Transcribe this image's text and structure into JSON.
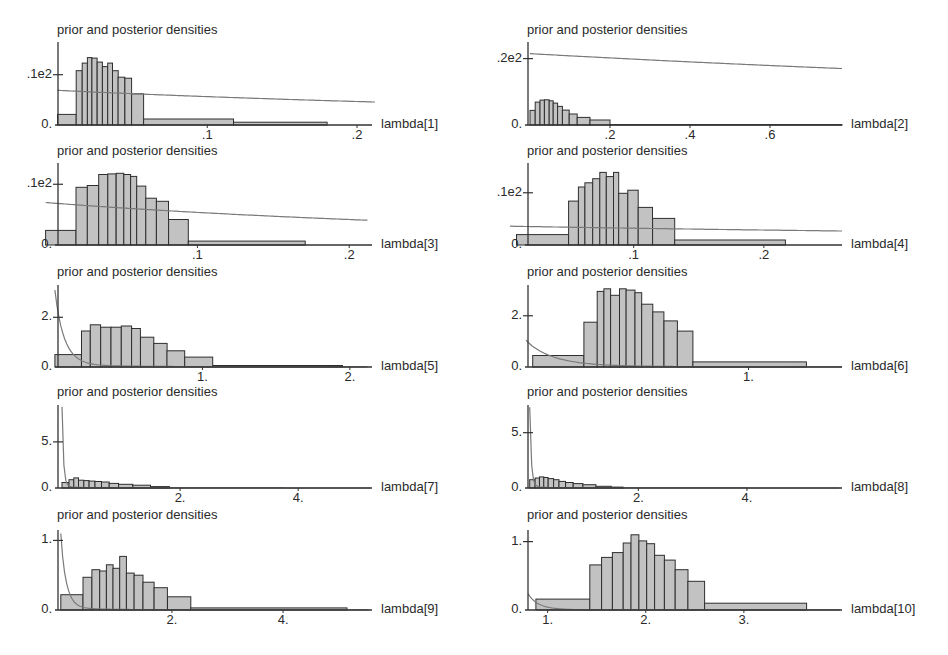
{
  "chart_data": [
    {
      "type": "bar",
      "title": "prior and posterior densities",
      "xlabel": "lambda[1]",
      "ylabel": "",
      "yticks": [
        {
          "v": 0,
          "label": "0."
        },
        {
          "v": 10,
          "label": ".1e2"
        }
      ],
      "xticks": [
        {
          "v": 0.1,
          "label": ".1"
        },
        {
          "v": 0.2,
          "label": ".2"
        }
      ],
      "xlim": [
        -0.005,
        0.21
      ],
      "ylim": [
        0,
        16.5
      ],
      "bars": [
        [
          0,
          0.0125,
          2.1
        ],
        [
          0.0125,
          0.0165,
          10.8
        ],
        [
          0.0165,
          0.02,
          12.3
        ],
        [
          0.02,
          0.023,
          13.4
        ],
        [
          0.023,
          0.0265,
          13.3
        ],
        [
          0.0265,
          0.03,
          12.5
        ],
        [
          0.03,
          0.0335,
          11.6
        ],
        [
          0.0335,
          0.0367,
          12.3
        ],
        [
          0.0367,
          0.0405,
          10.8
        ],
        [
          0.0405,
          0.045,
          9.5
        ],
        [
          0.045,
          0.0495,
          9.3
        ],
        [
          0.0495,
          0.0575,
          6.2
        ],
        [
          0.0575,
          0.1175,
          1.2
        ],
        [
          0.1175,
          0.18,
          0.55
        ]
      ],
      "prior": {
        "type": "decay",
        "y0": 6.9,
        "k": 0.6,
        "x_end": 0.212
      },
      "layout": {
        "col": 0,
        "baseline": 125,
        "top": 42,
        "x0px": 58,
        "x1px": 372,
        "title_y": 22,
        "xzero_px": 50
      }
    },
    {
      "type": "bar",
      "title": "prior and posterior densities",
      "xlabel": "lambda[2]",
      "yticks": [
        {
          "v": 0,
          "label": "0."
        },
        {
          "v": 20,
          "label": ".2e2"
        }
      ],
      "xticks": [
        {
          "v": 0.2,
          "label": ".2"
        },
        {
          "v": 0.4,
          "label": ".4"
        },
        {
          "v": 0.6,
          "label": ".6"
        }
      ],
      "xlim": [
        -0.01,
        0.78
      ],
      "ylim": [
        0,
        25
      ],
      "bars": [
        [
          0,
          0.013,
          4.4
        ],
        [
          0.013,
          0.025,
          6.9
        ],
        [
          0.025,
          0.036,
          7.5
        ],
        [
          0.036,
          0.048,
          7.6
        ],
        [
          0.048,
          0.058,
          7.3
        ],
        [
          0.058,
          0.069,
          6.6
        ],
        [
          0.069,
          0.081,
          5.6
        ],
        [
          0.081,
          0.098,
          4.5
        ],
        [
          0.098,
          0.118,
          3.3
        ],
        [
          0.118,
          0.15,
          2.3
        ],
        [
          0.15,
          0.2,
          1.5
        ],
        [
          0.2,
          0.78,
          0.12
        ]
      ],
      "prior": {
        "type": "decay",
        "y0": 21.5,
        "k": 0.09,
        "x_end": 0.78
      },
      "layout": {
        "col": 1,
        "baseline": 125,
        "top": 42,
        "x0px": 528,
        "x1px": 842,
        "title_y": 22,
        "xzero_px": 526
      }
    },
    {
      "type": "bar",
      "title": "prior and posterior densities",
      "xlabel": "lambda[3]",
      "yticks": [
        {
          "v": 0,
          "label": "0."
        },
        {
          "v": 10,
          "label": ".1e2"
        }
      ],
      "xticks": [
        {
          "v": 0.1,
          "label": ".1"
        },
        {
          "v": 0.2,
          "label": ".2"
        }
      ],
      "xlim": [
        -0.005,
        0.215
      ],
      "ylim": [
        0,
        13.5
      ],
      "bars": [
        [
          0,
          0.02,
          2.4
        ],
        [
          0.02,
          0.0275,
          9.5
        ],
        [
          0.0275,
          0.035,
          9.8
        ],
        [
          0.035,
          0.041,
          11.6
        ],
        [
          0.041,
          0.0465,
          11.7
        ],
        [
          0.0465,
          0.0515,
          11.8
        ],
        [
          0.0515,
          0.056,
          11.6
        ],
        [
          0.056,
          0.06,
          11.3
        ],
        [
          0.06,
          0.066,
          9.7
        ],
        [
          0.066,
          0.073,
          7.7
        ],
        [
          0.073,
          0.081,
          7.2
        ],
        [
          0.081,
          0.094,
          4.2
        ],
        [
          0.094,
          0.171,
          0.65
        ]
      ],
      "prior": {
        "type": "decay",
        "y0": 7.0,
        "k": 0.8,
        "x_end": 0.212
      },
      "layout": {
        "col": 0,
        "baseline": 245,
        "top": 163,
        "x0px": 58,
        "x1px": 372,
        "title_y": 143,
        "xzero_px": 38
      }
    },
    {
      "type": "bar",
      "title": "prior and posterior densities",
      "xlabel": "lambda[4]",
      "yticks": [
        {
          "v": 0,
          "label": "0."
        },
        {
          "v": 10,
          "label": ".1e2"
        }
      ],
      "xticks": [
        {
          "v": 0.1,
          "label": ".1"
        },
        {
          "v": 0.2,
          "label": ".2"
        }
      ],
      "xlim": [
        0.005,
        0.26
      ],
      "ylim": [
        0,
        15.7
      ],
      "bars": [
        [
          0.01,
          0.05,
          2.0
        ],
        [
          0.05,
          0.0575,
          8.4
        ],
        [
          0.0575,
          0.0625,
          11.1
        ],
        [
          0.0625,
          0.0685,
          11.9
        ],
        [
          0.0685,
          0.074,
          12.7
        ],
        [
          0.074,
          0.079,
          13.9
        ],
        [
          0.079,
          0.0845,
          13.1
        ],
        [
          0.0845,
          0.0885,
          13.9
        ],
        [
          0.0885,
          0.0955,
          9.9
        ],
        [
          0.0955,
          0.1035,
          10.5
        ],
        [
          0.1035,
          0.1145,
          7.2
        ],
        [
          0.1145,
          0.1315,
          5.1
        ],
        [
          0.1315,
          0.2165,
          0.95
        ]
      ],
      "prior": {
        "type": "decay",
        "y0": 3.6,
        "k": 0.35,
        "x_end": 0.26
      },
      "layout": {
        "col": 1,
        "baseline": 245,
        "top": 163,
        "x0px": 528,
        "x1px": 842,
        "title_y": 143,
        "xzero_px": 510
      }
    },
    {
      "type": "bar",
      "title": "prior and posterior densities",
      "xlabel": "lambda[5]",
      "yticks": [
        {
          "v": 0,
          "label": "0."
        },
        {
          "v": 2,
          "label": "2."
        }
      ],
      "xticks": [
        {
          "v": 1,
          "label": "1."
        },
        {
          "v": 2,
          "label": "2."
        }
      ],
      "xlim": [
        -0.02,
        2.15
      ],
      "ylim": [
        0,
        3.3
      ],
      "bars": [
        [
          0,
          0.18,
          0.5
        ],
        [
          0.18,
          0.24,
          1.45
        ],
        [
          0.24,
          0.31,
          1.7
        ],
        [
          0.31,
          0.38,
          1.6
        ],
        [
          0.38,
          0.45,
          1.6
        ],
        [
          0.45,
          0.52,
          1.65
        ],
        [
          0.52,
          0.58,
          1.55
        ],
        [
          0.58,
          0.67,
          1.2
        ],
        [
          0.67,
          0.76,
          0.95
        ],
        [
          0.76,
          0.88,
          0.65
        ],
        [
          0.88,
          1.07,
          0.4
        ],
        [
          1.07,
          1.95,
          0.06
        ]
      ],
      "prior": {
        "type": "decay",
        "y0": 3.1,
        "k": 5.0,
        "x_end": 2.12
      },
      "layout": {
        "col": 0,
        "baseline": 367,
        "top": 285,
        "x0px": 58,
        "x1px": 372,
        "title_y": 264,
        "xzero_px": 52
      }
    },
    {
      "type": "bar",
      "title": "prior and posterior densities",
      "xlabel": "lambda[6]",
      "yticks": [
        {
          "v": 0,
          "label": "0."
        },
        {
          "v": 2,
          "label": "2."
        }
      ],
      "xticks": [
        {
          "v": 1,
          "label": "1."
        }
      ],
      "xlim": [
        0.0,
        1.42
      ],
      "ylim": [
        0,
        3.2
      ],
      "bars": [
        [
          0.03,
          0.26,
          0.45
        ],
        [
          0.26,
          0.32,
          1.75
        ],
        [
          0.32,
          0.35,
          2.95
        ],
        [
          0.35,
          0.38,
          3.05
        ],
        [
          0.38,
          0.42,
          2.8
        ],
        [
          0.42,
          0.45,
          3.05
        ],
        [
          0.45,
          0.49,
          3.0
        ],
        [
          0.49,
          0.52,
          2.9
        ],
        [
          0.52,
          0.57,
          2.45
        ],
        [
          0.57,
          0.62,
          2.15
        ],
        [
          0.62,
          0.68,
          1.8
        ],
        [
          0.68,
          0.75,
          1.4
        ],
        [
          0.75,
          1.26,
          0.2
        ]
      ],
      "prior": {
        "type": "decay",
        "y0": 1.05,
        "k": 2.6,
        "x_end": 1.42
      },
      "layout": {
        "col": 1,
        "baseline": 367,
        "top": 285,
        "x0px": 528,
        "x1px": 842,
        "title_y": 264,
        "xzero_px": 526
      }
    },
    {
      "type": "bar",
      "title": "prior and posterior densities",
      "xlabel": "lambda[7]",
      "yticks": [
        {
          "v": 0,
          "label": "0."
        },
        {
          "v": 5,
          "label": "5."
        }
      ],
      "xticks": [
        {
          "v": 2,
          "label": "2."
        },
        {
          "v": 4,
          "label": "4."
        }
      ],
      "xlim": [
        -0.05,
        5.25
      ],
      "ylim": [
        0,
        9
      ],
      "bars": [
        [
          0,
          0.12,
          0.6
        ],
        [
          0.12,
          0.2,
          0.9
        ],
        [
          0.2,
          0.28,
          1.1
        ],
        [
          0.28,
          0.37,
          0.85
        ],
        [
          0.37,
          0.46,
          0.8
        ],
        [
          0.46,
          0.56,
          0.75
        ],
        [
          0.56,
          0.67,
          0.7
        ],
        [
          0.67,
          0.8,
          0.65
        ],
        [
          0.8,
          0.96,
          0.5
        ],
        [
          0.96,
          1.2,
          0.4
        ],
        [
          1.2,
          1.5,
          0.3
        ],
        [
          1.5,
          1.82,
          0.15
        ]
      ],
      "prior": {
        "type": "decay",
        "y0": 8.8,
        "k": 13.0,
        "x_end": 5.22
      },
      "layout": {
        "col": 0,
        "baseline": 488,
        "top": 405,
        "x0px": 58,
        "x1px": 372,
        "title_y": 384,
        "xzero_px": 59
      }
    },
    {
      "type": "bar",
      "title": "prior and posterior densities",
      "xlabel": "lambda[8]",
      "yticks": [
        {
          "v": 0,
          "label": "0."
        },
        {
          "v": 5,
          "label": "5."
        }
      ],
      "xticks": [
        {
          "v": 2,
          "label": "2."
        },
        {
          "v": 4,
          "label": "4."
        }
      ],
      "xlim": [
        -0.05,
        5.75
      ],
      "ylim": [
        0,
        7.5
      ],
      "bars": [
        [
          0,
          0.1,
          0.75
        ],
        [
          0.1,
          0.18,
          0.9
        ],
        [
          0.18,
          0.26,
          1.0
        ],
        [
          0.26,
          0.34,
          0.95
        ],
        [
          0.34,
          0.44,
          0.85
        ],
        [
          0.44,
          0.54,
          0.75
        ],
        [
          0.54,
          0.66,
          0.6
        ],
        [
          0.66,
          0.8,
          0.5
        ],
        [
          0.8,
          0.98,
          0.4
        ],
        [
          0.98,
          1.22,
          0.3
        ],
        [
          1.22,
          1.5,
          0.15
        ],
        [
          1.5,
          1.72,
          0.08
        ]
      ],
      "prior": {
        "type": "decay",
        "y0": 7.3,
        "k": 12.0,
        "x_end": 5.7
      },
      "layout": {
        "col": 1,
        "baseline": 488,
        "top": 405,
        "x0px": 528,
        "x1px": 842,
        "title_y": 384,
        "xzero_px": 527
      }
    },
    {
      "type": "bar",
      "title": "prior and posterior densities",
      "xlabel": "lambda[9]",
      "yticks": [
        {
          "v": 0,
          "label": "0."
        },
        {
          "v": 1,
          "label": "1."
        }
      ],
      "xticks": [
        {
          "v": 2,
          "label": "2."
        },
        {
          "v": 4,
          "label": "4."
        }
      ],
      "xlim": [
        -0.05,
        5.6
      ],
      "ylim": [
        0,
        1.15
      ],
      "bars": [
        [
          0,
          0.4,
          0.22
        ],
        [
          0.4,
          0.56,
          0.47
        ],
        [
          0.56,
          0.7,
          0.58
        ],
        [
          0.7,
          0.82,
          0.56
        ],
        [
          0.82,
          0.94,
          0.65
        ],
        [
          0.94,
          1.06,
          0.6
        ],
        [
          1.06,
          1.18,
          0.77
        ],
        [
          1.18,
          1.32,
          0.53
        ],
        [
          1.32,
          1.48,
          0.5
        ],
        [
          1.48,
          1.68,
          0.4
        ],
        [
          1.68,
          1.92,
          0.32
        ],
        [
          1.92,
          2.34,
          0.19
        ],
        [
          2.34,
          5.15,
          0.03
        ]
      ],
      "prior": {
        "type": "decay",
        "y0": 1.1,
        "k": 3.3,
        "x_end": 5.55
      },
      "layout": {
        "col": 0,
        "baseline": 610,
        "top": 530,
        "x0px": 58,
        "x1px": 372,
        "title_y": 507,
        "xzero_px": 58
      }
    },
    {
      "type": "bar",
      "title": "prior and posterior densities",
      "xlabel": "lambda[10]",
      "yticks": [
        {
          "v": 0,
          "label": "0."
        },
        {
          "v": 1,
          "label": "1."
        }
      ],
      "xticks": [
        {
          "v": 1,
          "label": "1."
        },
        {
          "v": 2,
          "label": "2."
        },
        {
          "v": 3,
          "label": "3."
        }
      ],
      "xlim": [
        0.8,
        4.0
      ],
      "ylim": [
        0,
        1.17
      ],
      "bars": [
        [
          0.88,
          1.43,
          0.16
        ],
        [
          1.43,
          1.55,
          0.66
        ],
        [
          1.55,
          1.66,
          0.77
        ],
        [
          1.66,
          1.77,
          0.84
        ],
        [
          1.77,
          1.85,
          0.98
        ],
        [
          1.85,
          1.93,
          1.1
        ],
        [
          1.93,
          2.01,
          1.01
        ],
        [
          2.01,
          2.09,
          0.97
        ],
        [
          2.09,
          2.19,
          0.8
        ],
        [
          2.19,
          2.3,
          0.73
        ],
        [
          2.3,
          2.43,
          0.59
        ],
        [
          2.43,
          2.6,
          0.42
        ],
        [
          2.6,
          3.64,
          0.1
        ]
      ],
      "prior": {
        "type": "decay_offset",
        "y0": 0.24,
        "k": 3.0,
        "xs": 0.8,
        "x_end": 3.98
      },
      "layout": {
        "col": 1,
        "baseline": 610,
        "top": 530,
        "x0px": 528,
        "x1px": 842,
        "title_y": 507,
        "xzero_px": 528
      }
    }
  ]
}
